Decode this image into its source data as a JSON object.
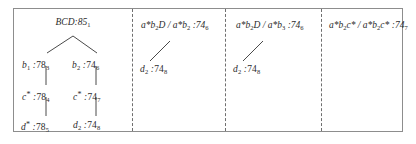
{
  "figure": {
    "caption_present": false,
    "border_color": "#8d8d8d",
    "divider_style": "dashed",
    "panels": [
      {
        "id": "panel-1",
        "type": "tree",
        "root": {
          "label": "BCD",
          "sep": ":",
          "value": "85",
          "index": "1"
        },
        "nodes": [
          {
            "id": "b1",
            "label": "b",
            "label_sub": "1",
            "star": false,
            "sep": ":",
            "value": "78",
            "index": "3"
          },
          {
            "id": "b2",
            "label": "b",
            "label_sub": "2",
            "star": false,
            "sep": ":",
            "value": "74",
            "index": "6"
          },
          {
            "id": "c-left",
            "label": "c",
            "label_sub": "",
            "star": true,
            "sep": ":",
            "value": "78",
            "index": "4"
          },
          {
            "id": "c-right",
            "label": "c",
            "label_sub": "",
            "star": true,
            "sep": ":",
            "value": "74",
            "index": "7"
          },
          {
            "id": "d-left",
            "label": "d",
            "label_sub": "",
            "star": true,
            "sep": ":",
            "value": "78",
            "index": "5"
          },
          {
            "id": "d-right",
            "label": "d",
            "label_sub": "2",
            "star": false,
            "sep": ":",
            "value": "74",
            "index": "8"
          }
        ]
      },
      {
        "id": "panel-2",
        "type": "rule",
        "header": {
          "num": "a*b",
          "num_sub": "2",
          "num_tail": "D",
          "den": "a*b",
          "den_sub": "2",
          "sep": ":",
          "value": "74",
          "index": "6"
        },
        "child": {
          "label": "d",
          "label_sub": "2",
          "star": false,
          "sep": ":",
          "value": "74",
          "index": "8"
        }
      },
      {
        "id": "panel-3",
        "type": "rule",
        "header": {
          "num": "a*b",
          "num_sub": "2",
          "num_tail": "D",
          "den": "a*b",
          "den_sub": "3",
          "sep": ":",
          "value": "74",
          "index": "6"
        },
        "child": {
          "label": "d",
          "label_sub": "2",
          "star": false,
          "sep": ":",
          "value": "74",
          "index": "8"
        }
      },
      {
        "id": "panel-4",
        "type": "rule",
        "header": {
          "num": "a*b",
          "num_sub": "2",
          "num_tail": "c*",
          "den": "a*b",
          "den_sub": "2",
          "den_tail": "c*",
          "sep": ":",
          "value": "74",
          "index": "7"
        },
        "child": null
      }
    ]
  }
}
